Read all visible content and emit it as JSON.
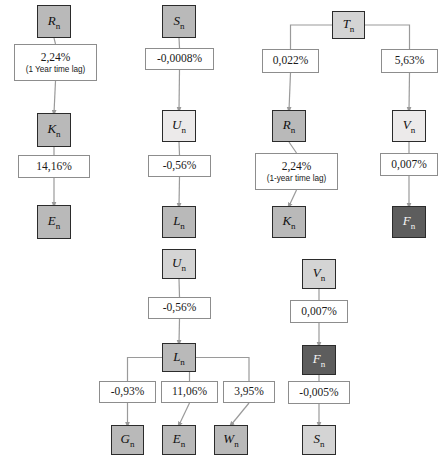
{
  "diagram": {
    "type": "flow-diagram",
    "canvas": {
      "width": 444,
      "height": 467
    },
    "colors": {
      "node_border": "#2b2b2b",
      "label_border": "#8d8d8d",
      "edge": "#9a9a9a",
      "shade_mid": "#b9b9b9",
      "shade_light": "#d4d4d4",
      "shade_pale": "#eceaea",
      "shade_dark": "#5d5d5d",
      "background": "#ffffff"
    },
    "nodes": [
      {
        "id": "c1n1",
        "var": "R",
        "sub": "n",
        "shade": "shade-mid",
        "x": 37,
        "y": 5,
        "w": 34,
        "h": 33
      },
      {
        "id": "c1n2",
        "var": "K",
        "sub": "n",
        "shade": "shade-mid",
        "x": 37,
        "y": 113,
        "w": 34,
        "h": 34
      },
      {
        "id": "c1n3",
        "var": "E",
        "sub": "n",
        "shade": "shade-mid",
        "x": 37,
        "y": 205,
        "w": 34,
        "h": 34
      },
      {
        "id": "c2n1",
        "var": "S",
        "sub": "n",
        "shade": "shade-mid",
        "x": 162,
        "y": 5,
        "w": 34,
        "h": 33
      },
      {
        "id": "c2n2",
        "var": "U",
        "sub": "n",
        "shade": "shade-pale",
        "x": 162,
        "y": 110,
        "w": 34,
        "h": 32
      },
      {
        "id": "c2n3",
        "var": "L",
        "sub": "n",
        "shade": "shade-mid",
        "x": 162,
        "y": 206,
        "w": 34,
        "h": 32
      },
      {
        "id": "c2n4",
        "var": "U",
        "sub": "n",
        "shade": "shade-light",
        "x": 162,
        "y": 249,
        "w": 34,
        "h": 30
      },
      {
        "id": "c2n5",
        "var": "L",
        "sub": "n",
        "shade": "shade-mid",
        "x": 162,
        "y": 343,
        "w": 34,
        "h": 29
      },
      {
        "id": "c2n6",
        "var": "G",
        "sub": "n",
        "shade": "shade-mid",
        "x": 111,
        "y": 425,
        "w": 33,
        "h": 30
      },
      {
        "id": "c2n7",
        "var": "E",
        "sub": "n",
        "shade": "shade-mid",
        "x": 162,
        "y": 425,
        "w": 34,
        "h": 30
      },
      {
        "id": "c2n8",
        "var": "W",
        "sub": "n",
        "shade": "shade-mid",
        "x": 214,
        "y": 425,
        "w": 34,
        "h": 30
      },
      {
        "id": "c3n1",
        "var": "T",
        "sub": "n",
        "shade": "shade-light",
        "x": 332,
        "y": 11,
        "w": 33,
        "h": 28
      },
      {
        "id": "c3n2",
        "var": "R",
        "sub": "n",
        "shade": "shade-mid",
        "x": 272,
        "y": 110,
        "w": 34,
        "h": 32
      },
      {
        "id": "c3n3",
        "var": "V",
        "sub": "n",
        "shade": "shade-pale",
        "x": 392,
        "y": 110,
        "w": 34,
        "h": 32
      },
      {
        "id": "c3n4",
        "var": "K",
        "sub": "n",
        "shade": "shade-mid",
        "x": 272,
        "y": 206,
        "w": 34,
        "h": 32
      },
      {
        "id": "c3n5",
        "var": "F",
        "sub": "n",
        "shade": "shade-dark",
        "x": 392,
        "y": 206,
        "w": 34,
        "h": 32
      },
      {
        "id": "c3n6",
        "var": "V",
        "sub": "n",
        "shade": "shade-light",
        "x": 302,
        "y": 259,
        "w": 34,
        "h": 30
      },
      {
        "id": "c3n7",
        "var": "F",
        "sub": "n",
        "shade": "shade-dark",
        "x": 302,
        "y": 345,
        "w": 34,
        "h": 30
      },
      {
        "id": "c3n8",
        "var": "S",
        "sub": "n",
        "shade": "shade-light",
        "x": 302,
        "y": 425,
        "w": 34,
        "h": 30
      }
    ],
    "labels": [
      {
        "id": "l1",
        "text": "2,24%",
        "note": "(1 Year time lag)",
        "x": 14,
        "y": 44,
        "w": 83,
        "h": 37
      },
      {
        "id": "l2",
        "text": "14,16%",
        "note": "",
        "x": 18,
        "y": 155,
        "w": 72,
        "h": 23
      },
      {
        "id": "l3",
        "text": "-0,0008%",
        "note": "",
        "x": 145,
        "y": 48,
        "w": 69,
        "h": 22
      },
      {
        "id": "l4",
        "text": "-0,56%",
        "note": "",
        "x": 148,
        "y": 155,
        "w": 63,
        "h": 22
      },
      {
        "id": "l5",
        "text": "-0,56%",
        "note": "",
        "x": 148,
        "y": 297,
        "w": 63,
        "h": 22
      },
      {
        "id": "l6",
        "text": "-0,93%",
        "note": "",
        "x": 99,
        "y": 381,
        "w": 57,
        "h": 22
      },
      {
        "id": "l7",
        "text": "11,06%",
        "note": "",
        "x": 161,
        "y": 381,
        "w": 57,
        "h": 22
      },
      {
        "id": "l8",
        "text": "3,95%",
        "note": "",
        "x": 223,
        "y": 381,
        "w": 52,
        "h": 22
      },
      {
        "id": "l9",
        "text": "0,022%",
        "note": "",
        "x": 262,
        "y": 49,
        "w": 57,
        "h": 24
      },
      {
        "id": "l10",
        "text": "5,63%",
        "note": "",
        "x": 381,
        "y": 49,
        "w": 57,
        "h": 24
      },
      {
        "id": "l11",
        "text": "2,24%",
        "note": "(1-year time lag)",
        "x": 255,
        "y": 153,
        "w": 83,
        "h": 37
      },
      {
        "id": "l12",
        "text": "0,007%",
        "note": "",
        "x": 380,
        "y": 153,
        "w": 58,
        "h": 23
      },
      {
        "id": "l13",
        "text": "0,007%",
        "note": "",
        "x": 290,
        "y": 300,
        "w": 58,
        "h": 23
      },
      {
        "id": "l14",
        "text": "-0,005%",
        "note": "",
        "x": 288,
        "y": 381,
        "w": 62,
        "h": 23
      }
    ],
    "edges": [
      {
        "from": "c1n1",
        "to": "l1",
        "kind": "plain"
      },
      {
        "from": "l1",
        "to": "c1n2",
        "kind": "arrow"
      },
      {
        "from": "c1n2",
        "to": "l2",
        "kind": "plain"
      },
      {
        "from": "l2",
        "to": "c1n3",
        "kind": "arrow"
      },
      {
        "from": "c2n1",
        "to": "l3",
        "kind": "plain"
      },
      {
        "from": "l3",
        "to": "c2n2",
        "kind": "arrow"
      },
      {
        "from": "c2n2",
        "to": "l4",
        "kind": "plain"
      },
      {
        "from": "l4",
        "to": "c2n3",
        "kind": "arrow"
      },
      {
        "from": "c2n4",
        "to": "l5",
        "kind": "plain"
      },
      {
        "from": "l5",
        "to": "c2n5",
        "kind": "arrow"
      },
      {
        "from": "c2n5",
        "to": "l6",
        "kind": "branch"
      },
      {
        "from": "c2n5",
        "to": "l7",
        "kind": "branch"
      },
      {
        "from": "c2n5",
        "to": "l8",
        "kind": "branch"
      },
      {
        "from": "l6",
        "to": "c2n6",
        "kind": "arrow"
      },
      {
        "from": "l7",
        "to": "c2n7",
        "kind": "arrow"
      },
      {
        "from": "l8",
        "to": "c2n8",
        "kind": "arrow"
      },
      {
        "from": "c3n1",
        "to": "l9",
        "kind": "branch"
      },
      {
        "from": "c3n1",
        "to": "l10",
        "kind": "branch"
      },
      {
        "from": "l9",
        "to": "c3n2",
        "kind": "arrow"
      },
      {
        "from": "l10",
        "to": "c3n3",
        "kind": "arrow"
      },
      {
        "from": "c3n2",
        "to": "l11",
        "kind": "plain"
      },
      {
        "from": "l11",
        "to": "c3n4",
        "kind": "arrow"
      },
      {
        "from": "c3n3",
        "to": "l12",
        "kind": "plain"
      },
      {
        "from": "l12",
        "to": "c3n5",
        "kind": "arrow"
      },
      {
        "from": "c3n6",
        "to": "l13",
        "kind": "plain"
      },
      {
        "from": "l13",
        "to": "c3n7",
        "kind": "arrow"
      },
      {
        "from": "c3n7",
        "to": "l14",
        "kind": "plain"
      },
      {
        "from": "l14",
        "to": "c3n8",
        "kind": "arrow"
      }
    ]
  }
}
